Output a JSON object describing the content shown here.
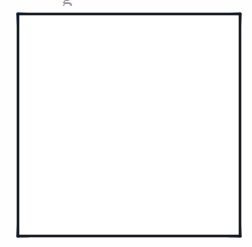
{
  "page": {
    "background_color": "#ffffff",
    "width": 252,
    "height": 247
  },
  "artifacts": {
    "clipped_glyph": "g",
    "clipped_glyph_note": "partially cropped letter at top edge of scan"
  },
  "figure": {
    "name": "four-petal-rosette",
    "frame": {
      "label": "square-border",
      "color": "#15181c",
      "stroke_width": 2.6,
      "x": 18,
      "y": 14,
      "side": 222
    },
    "grid": {
      "label": "graph-paper-grid",
      "color": "#d9d9d9",
      "stroke_width": 0.9,
      "columns": 7,
      "rows": 7,
      "cell_size": 31.7,
      "visible": true
    },
    "curves": {
      "color": "#2f5286",
      "stroke_width": 3.2,
      "count": 4,
      "description": "four semicircular arcs, one on each side of the square, diameter equal to the side"
    },
    "center_point": {
      "x": 129,
      "y": 125
    }
  },
  "chart_data": {
    "type": "line",
    "xlabel": "",
    "ylabel": "",
    "xlim": [
      0,
      7
    ],
    "ylim": [
      0,
      7
    ],
    "grid": true,
    "legend": "none",
    "annotations": [],
    "series": [
      {
        "name": "top-semicircle",
        "shape": "semicircle",
        "center": [
          3.5,
          0
        ],
        "radius": 3.5,
        "orientation": "opens-downward",
        "color": "#2f5286"
      },
      {
        "name": "bottom-semicircle",
        "shape": "semicircle",
        "center": [
          3.5,
          7
        ],
        "radius": 3.5,
        "orientation": "opens-upward",
        "color": "#2f5286"
      },
      {
        "name": "left-semicircle",
        "shape": "semicircle",
        "center": [
          0,
          3.5
        ],
        "radius": 3.5,
        "orientation": "opens-rightward",
        "color": "#2f5286"
      },
      {
        "name": "right-semicircle",
        "shape": "semicircle",
        "center": [
          7,
          3.5
        ],
        "radius": 3.5,
        "orientation": "opens-leftward",
        "color": "#2f5286"
      }
    ],
    "x_ticks": [
      0,
      1,
      2,
      3,
      4,
      5,
      6,
      7
    ],
    "y_ticks": [
      0,
      1,
      2,
      3,
      4,
      5,
      6,
      7
    ]
  }
}
